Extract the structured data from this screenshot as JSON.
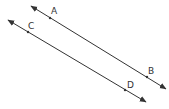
{
  "diagram": {
    "stroke_color": "#333333",
    "lines": [
      {
        "name": "AB",
        "x1": 31,
        "y1": 6,
        "x2": 166,
        "y2": 89,
        "points": [
          {
            "label": "A",
            "x": 50,
            "y": 18,
            "lx": 51,
            "ly": 14
          },
          {
            "label": "B",
            "x": 147,
            "y": 77,
            "lx": 148,
            "ly": 74
          }
        ]
      },
      {
        "name": "CD",
        "x1": 8,
        "y1": 20,
        "x2": 146,
        "y2": 102,
        "points": [
          {
            "label": "C",
            "x": 28,
            "y": 32,
            "lx": 28,
            "ly": 29
          },
          {
            "label": "D",
            "x": 125,
            "y": 90,
            "lx": 127,
            "ly": 88
          }
        ]
      }
    ]
  }
}
